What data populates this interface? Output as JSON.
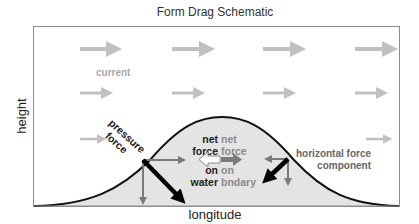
{
  "title": "Form Drag Schematic",
  "axes": {
    "x_label": "longitude",
    "y_label": "height"
  },
  "labels": {
    "current": "current",
    "pressure_force_line1": "pressure",
    "pressure_force_line2": "force",
    "net_force_water": [
      "net",
      "force",
      "on",
      "water"
    ],
    "net_force_boundary": [
      "net",
      "force",
      "on",
      "bndary"
    ],
    "horizontal_component_line1": "horizontal force",
    "horizontal_component_line2": "component"
  },
  "colors": {
    "frame": "#8c8c8c",
    "current_arrow": "#c0c0c0",
    "hill_fill": "#e4e4e4",
    "hill_outline": "#111111",
    "component_arrow": "#7a7a7a",
    "pressure_arrow": "#000000"
  },
  "current_rows": [
    {
      "name": "row-top",
      "size": "large",
      "y": 49,
      "x_starts": [
        80,
        172,
        263,
        355
      ]
    },
    {
      "name": "row-middle",
      "size": "medium",
      "y": 93,
      "x_starts": [
        80,
        172,
        263,
        355
      ]
    },
    {
      "name": "row-bottom",
      "size": "small",
      "y": 139,
      "x_starts": [
        80,
        365
      ]
    }
  ]
}
